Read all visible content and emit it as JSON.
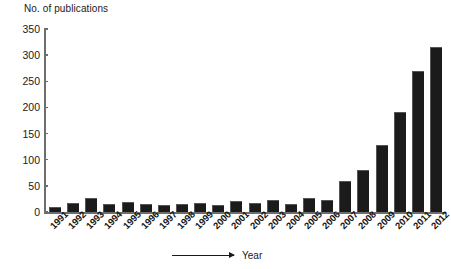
{
  "chart_data": {
    "type": "bar",
    "title": "No. of publications",
    "xlabel": "Year",
    "ylabel": "No. of publications",
    "categories": [
      "1991",
      "1992",
      "1993",
      "1994",
      "1995",
      "1996",
      "1997",
      "1998",
      "1999",
      "2000",
      "2001",
      "2002",
      "2003",
      "2004",
      "2005",
      "2006",
      "2007",
      "2008",
      "2009",
      "2010",
      "2011",
      "2012"
    ],
    "values": [
      7,
      15,
      24,
      13,
      17,
      14,
      12,
      13,
      16,
      11,
      20,
      15,
      22,
      14,
      25,
      22,
      58,
      78,
      126,
      190,
      267,
      314
    ],
    "ylim": [
      0,
      350
    ],
    "yticks": [
      "0",
      "50",
      "100",
      "150",
      "200",
      "250",
      "300",
      "350"
    ],
    "ytick_values": [
      0,
      50,
      100,
      150,
      200,
      250,
      300,
      350
    ],
    "grid": false,
    "legend": "none",
    "bar_color": "#1b1b1b",
    "axis_color": "#6e6e6e",
    "text_color": "#1a1a1a"
  },
  "axis": {
    "y_title": "No. of publications",
    "x_caption": "Year"
  }
}
